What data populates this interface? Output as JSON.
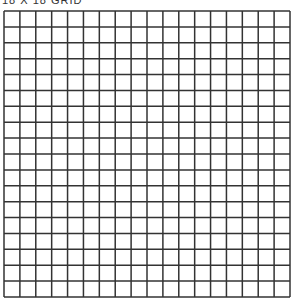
{
  "title": "18 X 18 GRID",
  "grid": {
    "rows": 18,
    "columns": 18,
    "line_color": "#333333",
    "background_color": "#ffffff"
  }
}
